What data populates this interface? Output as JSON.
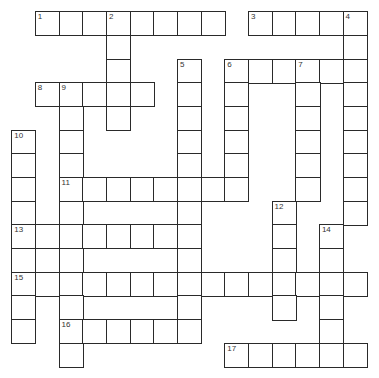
{
  "puzzle": {
    "type": "crossword",
    "rows": 15,
    "cols": 15,
    "cell_size_px": 23.67,
    "origin_px": [
      12,
      12
    ],
    "colors": {
      "line": "#2a2a2a",
      "cell": "#ffffff",
      "number": "#333333"
    },
    "cells": [
      [
        0,
        1
      ],
      [
        0,
        2
      ],
      [
        0,
        3
      ],
      [
        0,
        4
      ],
      [
        0,
        5
      ],
      [
        0,
        6
      ],
      [
        0,
        7
      ],
      [
        0,
        8
      ],
      [
        0,
        10
      ],
      [
        0,
        11
      ],
      [
        0,
        12
      ],
      [
        0,
        13
      ],
      [
        0,
        14
      ],
      [
        1,
        4
      ],
      [
        1,
        14
      ],
      [
        2,
        4
      ],
      [
        2,
        7
      ],
      [
        2,
        9
      ],
      [
        2,
        10
      ],
      [
        2,
        11
      ],
      [
        2,
        12
      ],
      [
        2,
        13
      ],
      [
        2,
        14
      ],
      [
        3,
        1
      ],
      [
        3,
        2
      ],
      [
        3,
        3
      ],
      [
        3,
        4
      ],
      [
        3,
        5
      ],
      [
        3,
        7
      ],
      [
        3,
        9
      ],
      [
        3,
        12
      ],
      [
        3,
        14
      ],
      [
        4,
        2
      ],
      [
        4,
        4
      ],
      [
        4,
        7
      ],
      [
        4,
        9
      ],
      [
        4,
        12
      ],
      [
        4,
        14
      ],
      [
        5,
        0
      ],
      [
        5,
        2
      ],
      [
        5,
        7
      ],
      [
        5,
        9
      ],
      [
        5,
        12
      ],
      [
        5,
        14
      ],
      [
        6,
        0
      ],
      [
        6,
        2
      ],
      [
        6,
        7
      ],
      [
        6,
        9
      ],
      [
        6,
        12
      ],
      [
        6,
        14
      ],
      [
        7,
        0
      ],
      [
        7,
        2
      ],
      [
        7,
        3
      ],
      [
        7,
        4
      ],
      [
        7,
        5
      ],
      [
        7,
        6
      ],
      [
        7,
        7
      ],
      [
        7,
        8
      ],
      [
        7,
        9
      ],
      [
        7,
        12
      ],
      [
        7,
        14
      ],
      [
        8,
        0
      ],
      [
        8,
        2
      ],
      [
        8,
        7
      ],
      [
        8,
        11
      ],
      [
        8,
        14
      ],
      [
        9,
        0
      ],
      [
        9,
        1
      ],
      [
        9,
        2
      ],
      [
        9,
        3
      ],
      [
        9,
        4
      ],
      [
        9,
        5
      ],
      [
        9,
        6
      ],
      [
        9,
        7
      ],
      [
        9,
        11
      ],
      [
        9,
        13
      ],
      [
        10,
        0
      ],
      [
        10,
        2
      ],
      [
        10,
        7
      ],
      [
        10,
        11
      ],
      [
        10,
        13
      ],
      [
        11,
        0
      ],
      [
        11,
        1
      ],
      [
        11,
        2
      ],
      [
        11,
        3
      ],
      [
        11,
        4
      ],
      [
        11,
        5
      ],
      [
        11,
        6
      ],
      [
        11,
        7
      ],
      [
        11,
        8
      ],
      [
        11,
        9
      ],
      [
        11,
        10
      ],
      [
        11,
        11
      ],
      [
        11,
        12
      ],
      [
        11,
        13
      ],
      [
        11,
        14
      ],
      [
        12,
        0
      ],
      [
        12,
        2
      ],
      [
        12,
        7
      ],
      [
        12,
        11
      ],
      [
        12,
        13
      ],
      [
        13,
        0
      ],
      [
        13,
        2
      ],
      [
        13,
        3
      ],
      [
        13,
        4
      ],
      [
        13,
        5
      ],
      [
        13,
        6
      ],
      [
        13,
        7
      ],
      [
        13,
        13
      ],
      [
        14,
        2
      ],
      [
        14,
        9
      ],
      [
        14,
        10
      ],
      [
        14,
        11
      ],
      [
        14,
        12
      ],
      [
        14,
        13
      ],
      [
        14,
        14
      ]
    ],
    "numbers": [
      {
        "n": "1",
        "r": 0,
        "c": 1
      },
      {
        "n": "2",
        "r": 0,
        "c": 4
      },
      {
        "n": "3",
        "r": 0,
        "c": 10
      },
      {
        "n": "4",
        "r": 0,
        "c": 14
      },
      {
        "n": "5",
        "r": 2,
        "c": 7
      },
      {
        "n": "6",
        "r": 2,
        "c": 9
      },
      {
        "n": "7",
        "r": 2,
        "c": 12
      },
      {
        "n": "8",
        "r": 3,
        "c": 1
      },
      {
        "n": "9",
        "r": 3,
        "c": 2
      },
      {
        "n": "10",
        "r": 5,
        "c": 0
      },
      {
        "n": "11",
        "r": 7,
        "c": 2
      },
      {
        "n": "12",
        "r": 8,
        "c": 11
      },
      {
        "n": "13",
        "r": 9,
        "c": 0
      },
      {
        "n": "14",
        "r": 9,
        "c": 13
      },
      {
        "n": "15",
        "r": 11,
        "c": 0
      },
      {
        "n": "16",
        "r": 13,
        "c": 2
      },
      {
        "n": "17",
        "r": 14,
        "c": 9
      }
    ],
    "entries": {
      "across": [
        {
          "n": "1",
          "r": 0,
          "c": 1,
          "len": 8
        },
        {
          "n": "3",
          "r": 0,
          "c": 10,
          "len": 5
        },
        {
          "n": "6",
          "r": 2,
          "c": 9,
          "len": 6
        },
        {
          "n": "8",
          "r": 3,
          "c": 1,
          "len": 5
        },
        {
          "n": "11",
          "r": 7,
          "c": 2,
          "len": 8
        },
        {
          "n": "13",
          "r": 9,
          "c": 0,
          "len": 8
        },
        {
          "n": "15",
          "r": 11,
          "c": 0,
          "len": 15
        },
        {
          "n": "16",
          "r": 13,
          "c": 2,
          "len": 6
        },
        {
          "n": "17",
          "r": 14,
          "c": 9,
          "len": 6
        }
      ],
      "down": [
        {
          "n": "2",
          "r": 0,
          "c": 4,
          "len": 5
        },
        {
          "n": "4",
          "r": 0,
          "c": 14,
          "len": 9
        },
        {
          "n": "5",
          "r": 2,
          "c": 7,
          "len": 12
        },
        {
          "n": "6",
          "r": 2,
          "c": 9,
          "len": 6
        },
        {
          "n": "7",
          "r": 2,
          "c": 12,
          "len": 6
        },
        {
          "n": "9",
          "r": 3,
          "c": 2,
          "len": 12
        },
        {
          "n": "10",
          "r": 5,
          "c": 0,
          "len": 9
        },
        {
          "n": "12",
          "r": 8,
          "c": 11,
          "len": 5
        },
        {
          "n": "14",
          "r": 9,
          "c": 13,
          "len": 6
        }
      ]
    }
  }
}
